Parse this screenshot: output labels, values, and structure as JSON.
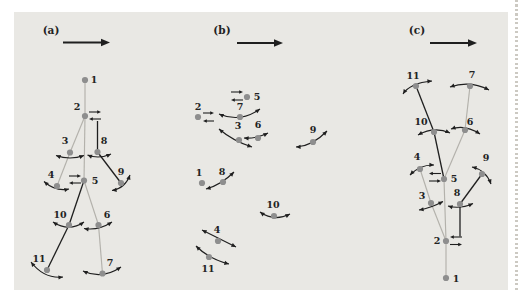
{
  "figure": {
    "colors": {
      "page": "#ffffff",
      "panel_bg": "#e9e8e4",
      "dot": "#8e8e8e",
      "bone_light": "#b3b1ab",
      "ink": "#1f1f1f",
      "label": "#222222",
      "page_edge_dots": "#ccc9c2"
    }
  },
  "panels": [
    {
      "id": "a",
      "label": "(a)",
      "label_pos": {
        "x": 51,
        "y": 34
      },
      "direction_arrow": {
        "x1": 63,
        "y1": 42.5,
        "x2": 110,
        "y2": 42.5
      },
      "nodes": [
        {
          "id": "1",
          "x": 85,
          "y": 80,
          "lx": 94,
          "ly": 83
        },
        {
          "id": "2",
          "x": 85,
          "y": 116,
          "lx": 77,
          "ly": 110
        },
        {
          "id": "3",
          "x": 70,
          "y": 152.5,
          "lx": 65,
          "ly": 144
        },
        {
          "id": "4",
          "x": 57,
          "y": 186,
          "lx": 51,
          "ly": 178
        },
        {
          "id": "5",
          "x": 84,
          "y": 180.5,
          "lx": 95,
          "ly": 184
        },
        {
          "id": "6",
          "x": 98.5,
          "y": 225,
          "lx": 107,
          "ly": 218
        },
        {
          "id": "7",
          "x": 102.5,
          "y": 273.5,
          "lx": 110,
          "ly": 266
        },
        {
          "id": "8",
          "x": 97.5,
          "y": 152,
          "lx": 104,
          "ly": 144
        },
        {
          "id": "9",
          "x": 121,
          "y": 183,
          "lx": 121,
          "ly": 175
        },
        {
          "id": "10",
          "x": 69,
          "y": 225,
          "lx": 60,
          "ly": 218
        },
        {
          "id": "11",
          "x": 47,
          "y": 270,
          "lx": 39,
          "ly": 262
        }
      ],
      "edges": [
        {
          "from": "1",
          "to": "2",
          "tone": "light",
          "x1": 85,
          "y1": 80,
          "x2": 85,
          "y2": 116
        },
        {
          "from": "2",
          "to": "5",
          "tone": "light",
          "x1": 85,
          "y1": 116,
          "x2": 84,
          "y2": 180.5
        },
        {
          "from": "2",
          "to": "3",
          "tone": "light",
          "x1": 85,
          "y1": 116,
          "x2": 70,
          "y2": 152.5
        },
        {
          "from": "3",
          "to": "4",
          "tone": "light",
          "x1": 70,
          "y1": 152.5,
          "x2": 57,
          "y2": 186
        },
        {
          "from": "5",
          "to": "6",
          "tone": "light",
          "x1": 84,
          "y1": 180.5,
          "x2": 98.5,
          "y2": 225
        },
        {
          "from": "6",
          "to": "7",
          "tone": "light",
          "x1": 98.5,
          "y1": 225,
          "x2": 102.5,
          "y2": 273.5
        },
        {
          "from": "2",
          "to": "8",
          "tone": "dark",
          "x1": 97.5,
          "y1": 121,
          "x2": 97.5,
          "y2": 152
        },
        {
          "from": "8",
          "to": "9",
          "tone": "dark",
          "x1": 97.5,
          "y1": 152,
          "x2": 121,
          "y2": 183
        },
        {
          "from": "5",
          "to": "10",
          "tone": "dark",
          "x1": 84,
          "y1": 180.5,
          "x2": 69,
          "y2": 225
        },
        {
          "from": "10",
          "to": "11",
          "tone": "dark",
          "x1": 69,
          "y1": 225,
          "x2": 47,
          "y2": 270
        }
      ],
      "marks": [
        {
          "type": "pair",
          "node": "2",
          "x1": 89,
          "x2": 101,
          "y_top": 112,
          "y_bot": 119,
          "top": "right",
          "bottom": "left"
        },
        {
          "type": "pair",
          "node": "5",
          "x1": 69,
          "x2": 81,
          "y_top": 176,
          "y_bot": 183,
          "top": "right",
          "bottom": "left"
        },
        {
          "type": "arc",
          "node": "3",
          "x1": 56,
          "y1": 155.5,
          "cx": 70,
          "cy": 160.5,
          "x2": 84,
          "y2": 155.5
        },
        {
          "type": "arc",
          "node": "8",
          "x1": 87.5,
          "y1": 155,
          "cx": 99,
          "cy": 159.5,
          "x2": 111,
          "y2": 154
        },
        {
          "type": "arc",
          "node": "4",
          "x1": 44,
          "y1": 181.5,
          "cx": 56,
          "cy": 192,
          "x2": 69,
          "y2": 189
        },
        {
          "type": "arc",
          "node": "9",
          "x1": 112,
          "y1": 190.5,
          "cx": 125,
          "cy": 188.5,
          "x2": 130,
          "y2": 175
        },
        {
          "type": "arc",
          "node": "10",
          "x1": 53,
          "y1": 222,
          "cx": 69,
          "cy": 232.5,
          "x2": 84,
          "y2": 222
        },
        {
          "type": "arc",
          "node": "6",
          "x1": 84,
          "y1": 228.5,
          "cx": 98,
          "cy": 231,
          "x2": 112,
          "y2": 222
        },
        {
          "type": "arc",
          "node": "11",
          "x1": 31,
          "y1": 262,
          "cx": 44,
          "cy": 279,
          "x2": 63,
          "y2": 277
        },
        {
          "type": "arc",
          "node": "7",
          "x1": 83,
          "y1": 271,
          "cx": 102,
          "cy": 280,
          "x2": 121,
          "y2": 267
        }
      ]
    },
    {
      "id": "b",
      "label": "(b)",
      "label_pos": {
        "x": 222,
        "y": 34
      },
      "direction_arrow": {
        "x1": 237,
        "y1": 43,
        "x2": 283,
        "y2": 43
      },
      "nodes": [
        {
          "id": "1",
          "x": 202,
          "y": 183,
          "lx": 199,
          "ly": 176
        },
        {
          "id": "2",
          "x": 198,
          "y": 117,
          "lx": 198,
          "ly": 110
        },
        {
          "id": "3",
          "x": 239,
          "y": 140,
          "lx": 238,
          "ly": 129
        },
        {
          "id": "4",
          "x": 218,
          "y": 241,
          "lx": 217,
          "ly": 233
        },
        {
          "id": "5",
          "x": 247,
          "y": 97,
          "lx": 257,
          "ly": 100
        },
        {
          "id": "6",
          "x": 258,
          "y": 138,
          "lx": 258,
          "ly": 128
        },
        {
          "id": "7",
          "x": 240,
          "y": 117,
          "lx": 240,
          "ly": 110
        },
        {
          "id": "8",
          "x": 223,
          "y": 182,
          "lx": 222,
          "ly": 175
        },
        {
          "id": "9",
          "x": 313,
          "y": 142,
          "lx": 313,
          "ly": 133
        },
        {
          "id": "10",
          "x": 274,
          "y": 216,
          "lx": 273,
          "ly": 208
        },
        {
          "id": "11",
          "x": 209,
          "y": 257,
          "lx": 208,
          "ly": 272
        }
      ],
      "edges": [],
      "marks": [
        {
          "type": "pair",
          "node": "2",
          "x1": 203,
          "x2": 214,
          "y_top": 113,
          "y_bot": 121,
          "top": "right",
          "bottom": "left"
        },
        {
          "type": "pair",
          "node": "5",
          "x1": 231,
          "x2": 243,
          "y_top": 92,
          "y_bot": 100,
          "top": "right",
          "bottom": "left"
        },
        {
          "type": "arc",
          "node": "7",
          "x1": 219,
          "y1": 114,
          "cx": 240,
          "cy": 123,
          "x2": 260,
          "y2": 109
        },
        {
          "type": "arc",
          "node": "3",
          "x1": 219,
          "y1": 129,
          "cx": 233,
          "cy": 141,
          "x2": 252,
          "y2": 147
        },
        {
          "type": "arc",
          "node": "6",
          "x1": 244,
          "y1": 138,
          "cx": 256,
          "cy": 139,
          "x2": 268,
          "y2": 133
        },
        {
          "type": "arc",
          "node": "9",
          "x1": 296,
          "y1": 147,
          "cx": 312,
          "cy": 146.5,
          "x2": 327,
          "y2": 131
        },
        {
          "type": "arc",
          "node": "8",
          "x1": 206,
          "y1": 189,
          "cx": 221,
          "cy": 185,
          "x2": 234,
          "y2": 172
        },
        {
          "type": "arc",
          "node": "10",
          "x1": 260,
          "y1": 212,
          "cx": 274,
          "cy": 222,
          "x2": 290,
          "y2": 214
        },
        {
          "type": "arc",
          "node": "4",
          "x1": 202,
          "y1": 230,
          "cx": 219,
          "cy": 238.5,
          "x2": 236,
          "y2": 247
        },
        {
          "type": "arc",
          "node": "11",
          "x1": 196,
          "y1": 246,
          "cx": 209,
          "cy": 259,
          "x2": 229,
          "y2": 264
        }
      ]
    },
    {
      "id": "c",
      "label": "(c)",
      "label_pos": {
        "x": 417,
        "y": 34
      },
      "direction_arrow": {
        "x1": 430,
        "y1": 43,
        "x2": 477,
        "y2": 43
      },
      "nodes": [
        {
          "id": "1",
          "x": 446,
          "y": 278,
          "lx": 456,
          "ly": 282
        },
        {
          "id": "2",
          "x": 446,
          "y": 241,
          "lx": 437,
          "ly": 244
        },
        {
          "id": "3",
          "x": 431,
          "y": 203,
          "lx": 422,
          "ly": 199
        },
        {
          "id": "4",
          "x": 420,
          "y": 169,
          "lx": 417,
          "ly": 160
        },
        {
          "id": "5",
          "x": 444,
          "y": 179,
          "lx": 454,
          "ly": 182
        },
        {
          "id": "6",
          "x": 465,
          "y": 130,
          "lx": 470,
          "ly": 125
        },
        {
          "id": "7",
          "x": 470,
          "y": 86,
          "lx": 472,
          "ly": 78
        },
        {
          "id": "8",
          "x": 460,
          "y": 204,
          "lx": 457,
          "ly": 196
        },
        {
          "id": "9",
          "x": 482,
          "y": 174,
          "lx": 486,
          "ly": 161
        },
        {
          "id": "10",
          "x": 434,
          "y": 132,
          "lx": 421,
          "ly": 125
        },
        {
          "id": "11",
          "x": 416,
          "y": 86,
          "lx": 413,
          "ly": 79
        }
      ],
      "edges": [
        {
          "from": "1",
          "to": "2",
          "tone": "light",
          "x1": 446,
          "y1": 278,
          "x2": 446,
          "y2": 241
        },
        {
          "from": "2",
          "to": "5",
          "tone": "light",
          "x1": 446,
          "y1": 241,
          "x2": 444,
          "y2": 179
        },
        {
          "from": "2",
          "to": "3",
          "tone": "light",
          "x1": 446,
          "y1": 241,
          "x2": 431,
          "y2": 203
        },
        {
          "from": "3",
          "to": "4",
          "tone": "light",
          "x1": 431,
          "y1": 203,
          "x2": 420,
          "y2": 169
        },
        {
          "from": "5",
          "to": "6",
          "tone": "light",
          "x1": 444,
          "y1": 179,
          "x2": 465,
          "y2": 130
        },
        {
          "from": "6",
          "to": "7",
          "tone": "light",
          "x1": 465,
          "y1": 130,
          "x2": 470,
          "y2": 86
        },
        {
          "from": "2",
          "to": "8",
          "tone": "dark",
          "x1": 460,
          "y1": 236.5,
          "x2": 460,
          "y2": 204
        },
        {
          "from": "8",
          "to": "9",
          "tone": "dark",
          "x1": 460,
          "y1": 204,
          "x2": 482,
          "y2": 174
        },
        {
          "from": "5",
          "to": "10",
          "tone": "dark",
          "x1": 444,
          "y1": 179,
          "x2": 434,
          "y2": 132
        },
        {
          "from": "10",
          "to": "11",
          "tone": "dark",
          "x1": 434,
          "y1": 132,
          "x2": 416,
          "y2": 86
        }
      ],
      "marks": [
        {
          "type": "pair",
          "node": "2",
          "x1": 450,
          "x2": 462,
          "y_top": 237,
          "y_bot": 244.5,
          "top": "left",
          "bottom": "right"
        },
        {
          "type": "pair",
          "node": "5",
          "x1": 429,
          "x2": 441,
          "y_top": 173.5,
          "y_bot": 181,
          "top": "left",
          "bottom": "right"
        },
        {
          "type": "arc",
          "node": "11",
          "x1": 403,
          "y1": 94,
          "cx": 410,
          "cy": 83,
          "x2": 432,
          "y2": 81
        },
        {
          "type": "arc",
          "node": "7",
          "x1": 450,
          "y1": 87,
          "cx": 470,
          "cy": 80,
          "x2": 489,
          "y2": 90
        },
        {
          "type": "arc",
          "node": "10",
          "x1": 418,
          "y1": 135,
          "cx": 434,
          "cy": 126,
          "x2": 450,
          "y2": 133
        },
        {
          "type": "arc",
          "node": "6",
          "x1": 451,
          "y1": 129,
          "cx": 465,
          "cy": 124,
          "x2": 480,
          "y2": 134
        },
        {
          "type": "arc",
          "node": "4",
          "x1": 410,
          "y1": 175,
          "cx": 420,
          "cy": 164.5,
          "x2": 434,
          "y2": 165
        },
        {
          "type": "arc",
          "node": "9",
          "x1": 472,
          "y1": 167,
          "cx": 486,
          "cy": 170,
          "x2": 491,
          "y2": 184
        },
        {
          "type": "arc",
          "node": "3",
          "x1": 419,
          "y1": 210,
          "cx": 431,
          "cy": 208,
          "x2": 443,
          "y2": 201.5
        },
        {
          "type": "arc",
          "node": "8",
          "x1": 448,
          "y1": 206,
          "cx": 460,
          "cy": 209.5,
          "x2": 473,
          "y2": 203.5
        }
      ]
    }
  ]
}
